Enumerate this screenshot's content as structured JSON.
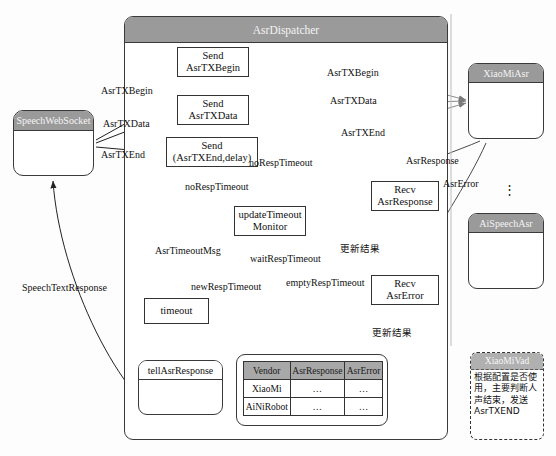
{
  "diagram": {
    "title_strip": "",
    "containers": {
      "dispatcher": "AsrDispatcher",
      "speech_websocket": "SpeechWebSocket",
      "xiaomi_asr": "XiaoMiAsr",
      "aispeech_asr": "AiSpeechAsr",
      "tell_asr_response": "tellAsrResponse",
      "vad_title": "XiaoMiVad",
      "vad_note": "根据配置是否使用，主要判断人声结束，发送AsrTXEND"
    },
    "nodes": {
      "send_begin_l1": "Send",
      "send_begin_l2": "AsrTXBegin",
      "send_data_l1": "Send",
      "send_data_l2": "AsrTXData",
      "send_end_l1": "Send",
      "send_end_l2": "(AsrTXEnd,delay)",
      "update_monitor_l1": "updateTimeout",
      "update_monitor_l2": "Monitor",
      "recv_response_l1": "Recv",
      "recv_response_l2": "AsrResponse",
      "recv_error_l1": "Recv",
      "recv_error_l2": "AsrError",
      "timeout": "timeout"
    },
    "edge_labels": {
      "ws_begin": "AsrTXBegin",
      "ws_data": "AsrTXData",
      "ws_end": "AsrTXEnd",
      "out_begin": "AsrTXBegin",
      "out_data": "AsrTXData",
      "out_end": "AsrTXEnd",
      "asr_response": "AsrResponse",
      "asr_error": "AsrError",
      "no_resp_timeout_a": "noRespTimeout",
      "no_resp_timeout_b": "noRespTimeout",
      "wait_resp_timeout": "waitRespTimeout",
      "new_resp_timeout": "newRespTimeout",
      "empty_resp_timeout": "emptyRespTimeout",
      "asr_timeout_msg": "AsrTimeoutMsg",
      "speech_text_response": "SpeechTextResponse",
      "update_result_1": "更新结果",
      "update_result_2": "更新结果"
    },
    "vendor_table": {
      "columns": [
        "Vendor",
        "AsrResponse",
        "AsrError"
      ],
      "rows": [
        [
          "XiaoMi",
          "…",
          "…"
        ],
        [
          "AiNiRobot",
          "…",
          "…"
        ]
      ]
    },
    "ellipsis": "⋮",
    "colors": {
      "band": "#9a9a9a",
      "table_header": "#a8a8a8",
      "stroke": "#333333",
      "page": "#fdfdfd"
    }
  }
}
